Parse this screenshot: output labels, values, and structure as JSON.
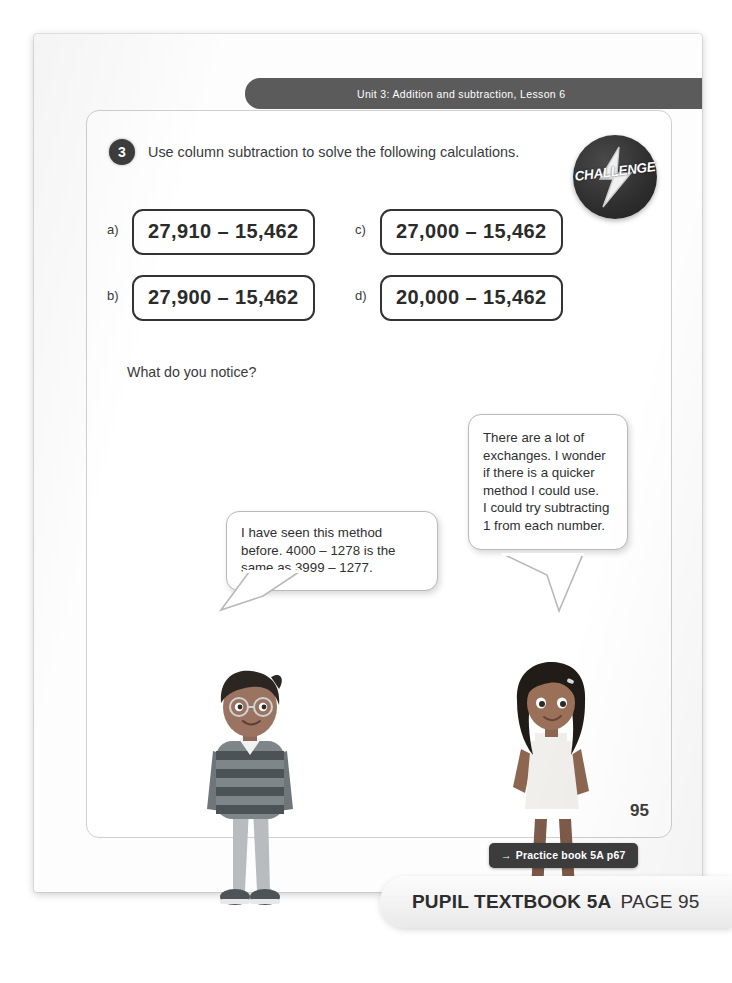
{
  "header": {
    "unit_banner": "Unit 3: Addition and subtraction, Lesson 6"
  },
  "question": {
    "number": "3",
    "prompt": "Use column subtraction to solve the following calculations.",
    "notice_prompt": "What do you notice?"
  },
  "challenge_badge": {
    "label": "CHALLENGE",
    "icon": "lightning-bolt-icon"
  },
  "calculations": [
    {
      "label": "a)",
      "expression": "27,910 – 15,462"
    },
    {
      "label": "c)",
      "expression": "27,000 – 15,462"
    },
    {
      "label": "b)",
      "expression": "27,900 – 15,462"
    },
    {
      "label": "d)",
      "expression": "20,000 – 15,462"
    }
  ],
  "speech_bubbles": {
    "boy": "I have seen this method before. 4000 – 1278 is the same as 3999 – 1277.",
    "girl": "There are a lot of exchanges. I wonder if there is a quicker method I could use.\nI could try subtracting 1 from each number."
  },
  "footer": {
    "page_number": "95",
    "practice_arrow": "→",
    "practice_label": "Practice book 5A p67",
    "caption_strong": "PUPIL TEXTBOOK 5A",
    "caption_light": "PAGE 95"
  },
  "colors": {
    "banner_grey": "#5b5b5b",
    "badge_dark": "#2e2e2e",
    "box_border": "#333333",
    "text_dark": "#2f2f2f"
  }
}
